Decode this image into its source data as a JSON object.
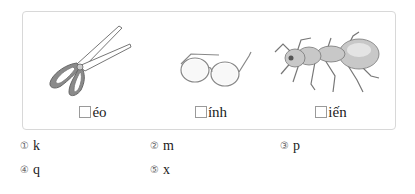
{
  "items": [
    {
      "picture": "scissors",
      "suffix": "éo"
    },
    {
      "picture": "glasses",
      "suffix": "ính"
    },
    {
      "picture": "ant",
      "suffix": "iến"
    }
  ],
  "options": [
    {
      "number": "①",
      "letter": "k"
    },
    {
      "number": "②",
      "letter": "m"
    },
    {
      "number": "③",
      "letter": "p"
    },
    {
      "number": "④",
      "letter": "q"
    },
    {
      "number": "⑤",
      "letter": "x"
    }
  ]
}
